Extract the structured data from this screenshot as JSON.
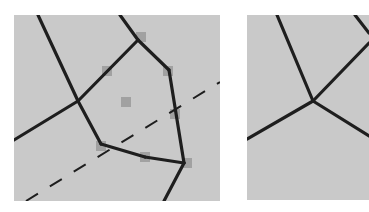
{
  "colors": {
    "background": "#ffffff",
    "panel_fill": "#c9c9c9",
    "edge_stroke": "#1e1e1e",
    "marker_fill": "#9a9a9a"
  },
  "left_panel": {
    "x": 14,
    "y": 15,
    "width": 206,
    "height": 186,
    "edges": [
      {
        "x1": 38,
        "y1": 15,
        "x2": 78,
        "y2": 101
      },
      {
        "x1": 14,
        "y1": 140,
        "x2": 78,
        "y2": 101
      },
      {
        "x1": 78,
        "y1": 101,
        "x2": 138,
        "y2": 40
      },
      {
        "x1": 120,
        "y1": 15,
        "x2": 138,
        "y2": 40
      },
      {
        "x1": 138,
        "y1": 40,
        "x2": 169,
        "y2": 70
      },
      {
        "x1": 169,
        "y1": 70,
        "x2": 184,
        "y2": 163
      },
      {
        "x1": 78,
        "y1": 101,
        "x2": 101,
        "y2": 144
      },
      {
        "x1": 101,
        "y1": 144,
        "x2": 145,
        "y2": 157
      },
      {
        "x1": 145,
        "y1": 157,
        "x2": 184,
        "y2": 163
      },
      {
        "x1": 184,
        "y1": 163,
        "x2": 164,
        "y2": 201
      }
    ],
    "dashed_line": {
      "x1": 26,
      "y1": 201,
      "x2": 220,
      "y2": 82
    },
    "markers": [
      {
        "x": 141,
        "y": 37
      },
      {
        "x": 107,
        "y": 71
      },
      {
        "x": 168,
        "y": 71
      },
      {
        "x": 126,
        "y": 102
      },
      {
        "x": 175,
        "y": 114
      },
      {
        "x": 101,
        "y": 146
      },
      {
        "x": 145,
        "y": 157
      },
      {
        "x": 187,
        "y": 163
      }
    ]
  },
  "right_panel": {
    "x": 247,
    "y": 15,
    "width": 122,
    "height": 185,
    "edges": [
      {
        "x1": 277,
        "y1": 15,
        "x2": 313,
        "y2": 101
      },
      {
        "x1": 313,
        "y1": 101,
        "x2": 369,
        "y2": 43
      },
      {
        "x1": 247,
        "y1": 139,
        "x2": 313,
        "y2": 101
      },
      {
        "x1": 313,
        "y1": 101,
        "x2": 369,
        "y2": 136
      },
      {
        "x1": 355,
        "y1": 15,
        "x2": 369,
        "y2": 33
      }
    ]
  }
}
